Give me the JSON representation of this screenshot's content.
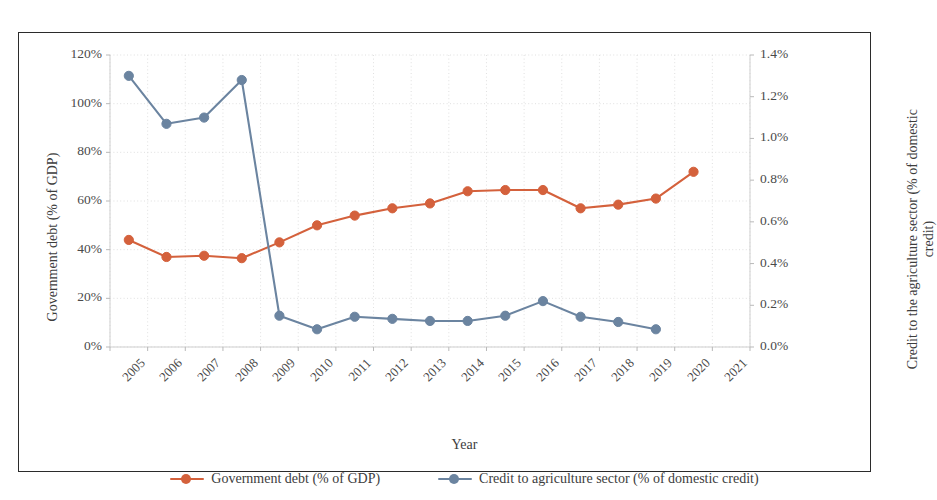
{
  "chart_data": {
    "type": "line",
    "title": "",
    "xlabel": "Year",
    "ylabel": "Government debt (% of GDP)",
    "y2label": "Credit to the agriculture sector (% of domestic credit)",
    "grid": true,
    "legend_position": "bottom",
    "categories": [
      "2005",
      "2006",
      "2007",
      "2008",
      "2009",
      "2010",
      "2011",
      "2012",
      "2013",
      "2014",
      "2015",
      "2016",
      "2017",
      "2018",
      "2019",
      "2020",
      "2021"
    ],
    "ylim": [
      0,
      120
    ],
    "y2lim": [
      0,
      1.4
    ],
    "ytick_labels": [
      "0%",
      "20%",
      "40%",
      "60%",
      "80%",
      "100%",
      "120%"
    ],
    "ytick_values": [
      0,
      20,
      40,
      60,
      80,
      100,
      120
    ],
    "y2tick_labels": [
      "0.0%",
      "0.2%",
      "0.4%",
      "0.6%",
      "0.8%",
      "1.0%",
      "1.2%",
      "1.4%"
    ],
    "y2tick_values": [
      0.0,
      0.2,
      0.4,
      0.6,
      0.8,
      1.0,
      1.2,
      1.4
    ],
    "series": [
      {
        "name": "Government debt (% of GDP)",
        "axis": "left",
        "color": "#d4613c",
        "marker": "circle",
        "values": [
          44.0,
          37.0,
          37.5,
          36.5,
          43.0,
          50.0,
          54.0,
          57.0,
          59.0,
          64.0,
          64.5,
          64.5,
          57.0,
          58.5,
          61.0,
          72.0,
          null
        ]
      },
      {
        "name": "Credit to agriculture sector (% of domestic credit)",
        "axis": "right",
        "color": "#6b84a0",
        "marker": "circle",
        "values": [
          1.3,
          1.07,
          1.1,
          1.28,
          0.15,
          0.085,
          0.145,
          0.135,
          0.125,
          0.125,
          0.15,
          0.22,
          0.145,
          0.12,
          0.085,
          null,
          null
        ]
      }
    ]
  },
  "legend": {
    "entries": [
      {
        "label": "Government debt (% of GDP)",
        "color": "#d4613c"
      },
      {
        "label": "Credit to agriculture sector (% of domestic credit)",
        "color": "#6b84a0"
      }
    ]
  },
  "axis_titles": {
    "left": "Government debt (% of GDP)",
    "right": "Credit to the agriculture sector (% of domestic credit)",
    "bottom": "Year"
  },
  "colors": {
    "series_government_debt": "#d4613c",
    "series_agriculture_credit": "#6b84a0",
    "frame": "#2b2b2b",
    "grid": "#dcdcdc",
    "text": "#3d3d3d",
    "background": "#ffffff"
  }
}
